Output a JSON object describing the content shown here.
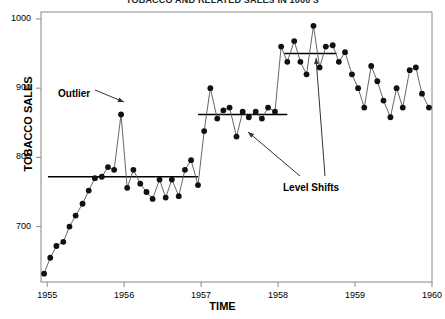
{
  "title": "TOBACCO AND RELATED SALES IN 1000'S",
  "axes": {
    "y_label": "TOBACCO SALES",
    "x_label": "TIME",
    "y_ticks": [
      700,
      800,
      900,
      1000
    ],
    "x_ticks": [
      1955,
      1956,
      1957,
      1958,
      1959,
      1960
    ],
    "ylim": [
      620,
      1010
    ],
    "xlim": [
      1954.92,
      1960.0
    ]
  },
  "annotations": [
    {
      "name": "outlier",
      "text": "Outlier",
      "x": 58,
      "y": 88
    },
    {
      "name": "level-shifts",
      "text": "Level Shifts",
      "x": 283,
      "y": 182
    }
  ],
  "colors": {
    "marker": "#111111",
    "line": "#555555",
    "level": "#000000",
    "axis": "#888888",
    "text": "#000000"
  },
  "chart_data": {
    "type": "line",
    "title": "TOBACCO AND RELATED SALES IN 1000'S",
    "xlabel": "TIME",
    "ylabel": "TOBACCO SALES",
    "ylim": [
      620,
      1010
    ],
    "xlim": [
      1954.92,
      1960.0
    ],
    "grid": false,
    "legend": null,
    "marker": "filled-circle",
    "series": [
      {
        "name": "Tobacco Sales",
        "x": [
          1954.96,
          1955.04,
          1955.12,
          1955.21,
          1955.29,
          1955.37,
          1955.46,
          1955.54,
          1955.62,
          1955.71,
          1955.79,
          1955.87,
          1955.96,
          1956.04,
          1956.12,
          1956.21,
          1956.29,
          1956.37,
          1956.46,
          1956.54,
          1956.62,
          1956.71,
          1956.79,
          1956.87,
          1956.96,
          1957.04,
          1957.12,
          1957.21,
          1957.29,
          1957.37,
          1957.46,
          1957.54,
          1957.62,
          1957.71,
          1957.79,
          1957.87,
          1957.96,
          1958.04,
          1958.12,
          1958.21,
          1958.29,
          1958.37,
          1958.46,
          1958.54,
          1958.62,
          1958.71,
          1958.79,
          1958.87,
          1958.96,
          1959.04,
          1959.12,
          1959.21,
          1959.29,
          1959.37,
          1959.46,
          1959.54,
          1959.62,
          1959.71,
          1959.79,
          1959.87,
          1959.96
        ],
        "y": [
          632,
          655,
          672,
          678,
          700,
          716,
          733,
          752,
          770,
          772,
          786,
          782,
          862,
          756,
          782,
          762,
          750,
          740,
          768,
          742,
          768,
          744,
          782,
          796,
          760,
          838,
          900,
          856,
          868,
          872,
          830,
          866,
          858,
          866,
          856,
          872,
          866,
          960,
          938,
          968,
          938,
          920,
          990,
          930,
          960,
          962,
          938,
          952,
          920,
          900,
          872,
          932,
          910,
          882,
          858,
          900,
          872,
          926,
          930,
          892,
          872
        ]
      }
    ],
    "level_shift_lines": [
      {
        "name": "level-1",
        "y": 772,
        "x_start": 1955.01,
        "x_end": 1956.96
      },
      {
        "name": "level-2",
        "y": 862,
        "x_start": 1956.96,
        "x_end": 1958.12
      },
      {
        "name": "level-3",
        "y": 950,
        "x_start": 1958.08,
        "x_end": 1958.76
      }
    ],
    "outlier": {
      "x": 1955.96,
      "y": 862
    }
  }
}
